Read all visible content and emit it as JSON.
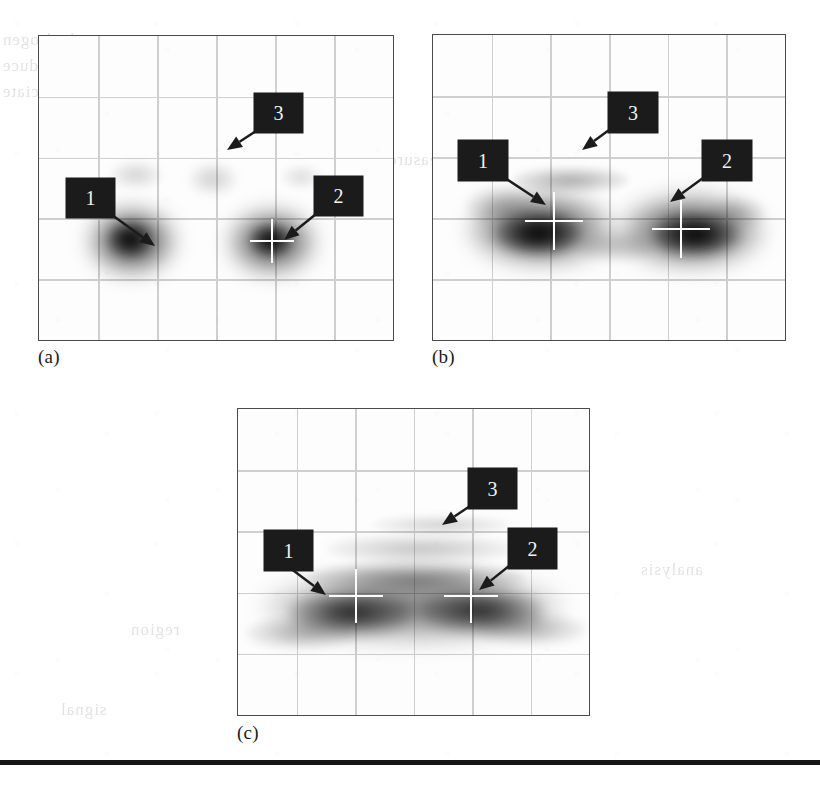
{
  "figure": {
    "kind": "scanned-book-figure",
    "panel_count": 3,
    "callout_numbers": [
      "1",
      "2",
      "3"
    ]
  },
  "panels": [
    {
      "id": "a",
      "caption": "(a)",
      "frame": {
        "x": 38,
        "y": 35,
        "w": 356,
        "h": 306
      },
      "caption_pos": {
        "x": 38,
        "y": 346
      },
      "grid": {
        "cols": 6,
        "rows": 5
      },
      "callouts": [
        {
          "number": "1",
          "box": {
            "x": 66,
            "y": 178,
            "w": 49,
            "h": 40
          },
          "arrow": {
            "x1": 112,
            "y1": 215,
            "x2": 155,
            "y2": 246
          }
        },
        {
          "number": "2",
          "box": {
            "x": 314,
            "y": 176,
            "w": 49,
            "h": 40
          },
          "arrow": {
            "x1": 316,
            "y1": 214,
            "x2": 284,
            "y2": 240
          }
        },
        {
          "number": "3",
          "box": {
            "x": 254,
            "y": 93,
            "w": 49,
            "h": 40
          },
          "arrow": {
            "x1": 256,
            "y1": 131,
            "x2": 227,
            "y2": 150
          }
        }
      ],
      "crosshairs": [
        {
          "x": 271,
          "y": 240,
          "size": 44
        }
      ],
      "blobs": [
        {
          "cx": 131,
          "cy": 240,
          "rx": 44,
          "ry": 34,
          "strength": 0.88
        },
        {
          "cx": 129,
          "cy": 238,
          "rx": 22,
          "ry": 17,
          "strength": 0.96
        },
        {
          "cx": 271,
          "cy": 241,
          "rx": 44,
          "ry": 33,
          "strength": 0.82
        },
        {
          "cx": 270,
          "cy": 239,
          "rx": 21,
          "ry": 16,
          "strength": 0.92
        },
        {
          "cx": 135,
          "cy": 174,
          "rx": 26,
          "ry": 14,
          "strength": 0.16
        },
        {
          "cx": 212,
          "cy": 178,
          "rx": 24,
          "ry": 16,
          "strength": 0.18
        },
        {
          "cx": 300,
          "cy": 176,
          "rx": 20,
          "ry": 12,
          "strength": 0.12
        }
      ]
    },
    {
      "id": "b",
      "caption": "(b)",
      "frame": {
        "x": 432,
        "y": 34,
        "w": 354,
        "h": 307
      },
      "caption_pos": {
        "x": 432,
        "y": 346
      },
      "grid": {
        "cols": 6,
        "rows": 5
      },
      "callouts": [
        {
          "number": "1",
          "box": {
            "x": 458,
            "y": 140,
            "w": 50,
            "h": 41
          },
          "arrow": {
            "x1": 505,
            "y1": 178,
            "x2": 546,
            "y2": 205
          }
        },
        {
          "number": "2",
          "box": {
            "x": 702,
            "y": 140,
            "w": 50,
            "h": 41
          },
          "arrow": {
            "x1": 703,
            "y1": 178,
            "x2": 670,
            "y2": 202
          }
        },
        {
          "number": "3",
          "box": {
            "x": 608,
            "y": 92,
            "w": 50,
            "h": 41
          },
          "arrow": {
            "x1": 609,
            "y1": 130,
            "x2": 582,
            "y2": 150
          }
        }
      ],
      "crosshairs": [
        {
          "x": 553,
          "y": 220,
          "size": 58
        },
        {
          "x": 680,
          "y": 228,
          "size": 58
        }
      ],
      "blobs": [
        {
          "cx": 540,
          "cy": 228,
          "rx": 72,
          "ry": 36,
          "strength": 0.84
        },
        {
          "cx": 537,
          "cy": 233,
          "rx": 44,
          "ry": 20,
          "strength": 0.95
        },
        {
          "cx": 690,
          "cy": 230,
          "rx": 72,
          "ry": 36,
          "strength": 0.84
        },
        {
          "cx": 695,
          "cy": 234,
          "rx": 44,
          "ry": 20,
          "strength": 0.95
        },
        {
          "cx": 570,
          "cy": 179,
          "rx": 58,
          "ry": 13,
          "strength": 0.3
        },
        {
          "cx": 615,
          "cy": 245,
          "rx": 40,
          "ry": 16,
          "strength": 0.22
        },
        {
          "cx": 500,
          "cy": 205,
          "rx": 36,
          "ry": 18,
          "strength": 0.22
        },
        {
          "cx": 735,
          "cy": 212,
          "rx": 30,
          "ry": 16,
          "strength": 0.18
        }
      ]
    },
    {
      "id": "c",
      "caption": "(c)",
      "frame": {
        "x": 237,
        "y": 408,
        "w": 353,
        "h": 308
      },
      "caption_pos": {
        "x": 237,
        "y": 722
      },
      "grid": {
        "cols": 6,
        "rows": 5
      },
      "callouts": [
        {
          "number": "1",
          "box": {
            "x": 264,
            "y": 530,
            "w": 49,
            "h": 41
          },
          "arrow": {
            "x1": 290,
            "y1": 568,
            "x2": 326,
            "y2": 595
          }
        },
        {
          "number": "2",
          "box": {
            "x": 508,
            "y": 528,
            "w": 49,
            "h": 41
          },
          "arrow": {
            "x1": 509,
            "y1": 566,
            "x2": 479,
            "y2": 590
          }
        },
        {
          "number": "3",
          "box": {
            "x": 468,
            "y": 468,
            "w": 49,
            "h": 41
          },
          "arrow": {
            "x1": 470,
            "y1": 506,
            "x2": 442,
            "y2": 525
          }
        }
      ],
      "crosshairs": [
        {
          "x": 355,
          "y": 595,
          "size": 54
        },
        {
          "x": 470,
          "y": 595,
          "size": 54
        }
      ],
      "blobs": [
        {
          "cx": 412,
          "cy": 606,
          "rx": 150,
          "ry": 36,
          "strength": 0.55
        },
        {
          "cx": 350,
          "cy": 612,
          "rx": 62,
          "ry": 22,
          "strength": 0.82
        },
        {
          "cx": 480,
          "cy": 610,
          "rx": 62,
          "ry": 22,
          "strength": 0.8
        },
        {
          "cx": 415,
          "cy": 578,
          "rx": 110,
          "ry": 16,
          "strength": 0.4
        },
        {
          "cx": 420,
          "cy": 548,
          "rx": 95,
          "ry": 14,
          "strength": 0.22
        },
        {
          "cx": 440,
          "cy": 524,
          "rx": 70,
          "ry": 10,
          "strength": 0.16
        },
        {
          "cx": 300,
          "cy": 632,
          "rx": 55,
          "ry": 16,
          "strength": 0.28
        },
        {
          "cx": 530,
          "cy": 628,
          "rx": 55,
          "ry": 16,
          "strength": 0.26
        }
      ]
    }
  ],
  "rule": {
    "x": 0,
    "y": 760,
    "w": 820,
    "h": 5,
    "color": "#161616"
  },
  "bleed_through": [
    {
      "text": "hydrogen",
      "x": 2,
      "y": 30
    },
    {
      "text": "produce",
      "x": 2,
      "y": 56
    },
    {
      "text": "dissociate",
      "x": 2,
      "y": 82
    },
    {
      "text": "volume",
      "x": 188,
      "y": 40
    },
    {
      "text": "current",
      "x": 196,
      "y": 66
    },
    {
      "text": "electron",
      "x": 180,
      "y": 92
    },
    {
      "text": "measurement",
      "x": 350,
      "y": 150
    },
    {
      "text": "spectra",
      "x": 560,
      "y": 40
    },
    {
      "text": "region",
      "x": 130,
      "y": 620
    },
    {
      "text": "analysis",
      "x": 640,
      "y": 560
    },
    {
      "text": "signal",
      "x": 60,
      "y": 700
    }
  ],
  "colors": {
    "frame": "#4a4a4a",
    "gridline": "#cfcfcf",
    "callout_bg": "#1b1b1b",
    "callout_fg": "#f2f2f2",
    "blob": "#000000",
    "crosshair": "#fbfbfb",
    "paper": "#ffffff"
  }
}
